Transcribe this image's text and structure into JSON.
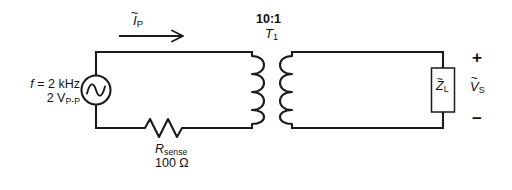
{
  "diagram": {
    "line_color": "#1b1b1b",
    "background": "#ffffff"
  },
  "source": {
    "frequency_label": "f = 2 kHz",
    "frequency_symbol": "f",
    "frequency_value": "= 2 kHz",
    "amplitude_value": "2 V",
    "amplitude_subscript": "P-P",
    "symbol_name": "ac-voltage-source"
  },
  "current": {
    "symbol": "I",
    "subscript": "P",
    "tilde": "~",
    "direction": "right"
  },
  "transformer": {
    "turns_ratio": "10:1",
    "designator": "T",
    "designator_subscript": "1",
    "primary_turns_drawn": 4,
    "secondary_turns_drawn": 4
  },
  "resistor": {
    "symbol": "R",
    "subscript": "sense",
    "value": "100 Ω"
  },
  "load": {
    "symbol": "Z",
    "subscript": "L",
    "tilde": "~"
  },
  "output_voltage": {
    "symbol": "V",
    "subscript": "S",
    "tilde": "~",
    "plus": "+",
    "minus": "−"
  }
}
